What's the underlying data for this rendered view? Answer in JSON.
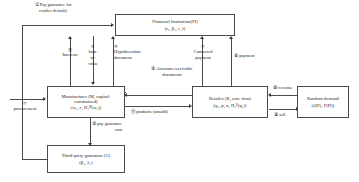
{
  "diagram": {
    "nodes": {
      "financial_institution": {
        "line1": "Financial Institution(FI)",
        "line2": "(r₁, β₁, r_f)"
      },
      "manufacturer": {
        "line1": "Manufacturer (M, capital-constrained)",
        "line2": "(w₁, c, Π₁ᴹ(w₁))"
      },
      "retailer": {
        "line1": "Retailer (R, core firm)",
        "line2": "(q₁, p, α, Π₁ᴿ(q₁))"
      },
      "random_demand": {
        "line1": "Random demand",
        "line2": "(f(D), F(D))"
      },
      "third_party_guarantor": {
        "line1": "Third-party guarantor (G)",
        "line2": "(β₁, λ₁)"
      }
    },
    "flows": [
      {
        "id": "1",
        "marker": "①",
        "label": "Pay guarantee for retailer default",
        "from": "third-party-guarantor",
        "to": "financial-institution"
      },
      {
        "id": "2",
        "marker": "②",
        "label": "loan-to-value",
        "from": "financial-institution",
        "to": "manufacturer"
      },
      {
        "id": "3",
        "marker": "③",
        "label": "Hypothecation document",
        "from": "manufacturer",
        "to": "financial-institution"
      },
      {
        "id": "4",
        "marker": "④",
        "label": "Accounts receivable documents",
        "from": "retailer",
        "to": "manufacturer"
      },
      {
        "id": "5",
        "marker": "⑤",
        "label": "Connected payment",
        "from": "retailer",
        "to": "financial-institution"
      },
      {
        "id": "6",
        "marker": "⑥",
        "label": "payment",
        "from": "retailer",
        "to": "financial-institution"
      },
      {
        "id": "7",
        "marker": "⑦",
        "label": "procurement",
        "from": "external",
        "to": "manufacturer"
      },
      {
        "id": "8",
        "marker": "⑧",
        "label": "sell",
        "from": "retailer",
        "to": "random-demand"
      },
      {
        "id": "9",
        "marker": "⑨",
        "label": "pay guarantee cost",
        "from": "manufacturer",
        "to": "third-party-guarantor"
      },
      {
        "id": "10",
        "marker": "⑩",
        "label": "revenue",
        "from": "random-demand",
        "to": "retailer"
      },
      {
        "id": "11",
        "marker": "⑪",
        "label": "products (unsold)",
        "from": "manufacturer",
        "to": "retailer"
      },
      {
        "id": "12",
        "marker": "⑫",
        "label": "Interests",
        "from": "manufacturer",
        "to": "financial-institution"
      }
    ],
    "labels": {
      "pay_guarantee_l1": "① Pay guarantee for",
      "pay_guarantee_l2": "retailer default)",
      "interests_num": "⑫",
      "interests_txt": "Interests",
      "ltv_num": "②",
      "ltv_l1": "loan-",
      "ltv_l2": "to-",
      "ltv_l3": "value",
      "hyp_num": "③",
      "hyp_l1": "Hypothecation",
      "hyp_l2": "document",
      "conn_num": "⑤",
      "conn_l1": "Connected",
      "conn_l2": "payment",
      "payment": "⑥ payment",
      "ar_l1": "④ Accounts receivable",
      "ar_l2": "documents",
      "procurement_num": "⑦",
      "procurement_txt": "procurement",
      "products": "⑪ products (unsold)",
      "guarantee_l1": "⑨ pay guarantee",
      "guarantee_l2": "cost",
      "revenue": "⑩ revenue",
      "sell": "⑧ sell"
    }
  }
}
